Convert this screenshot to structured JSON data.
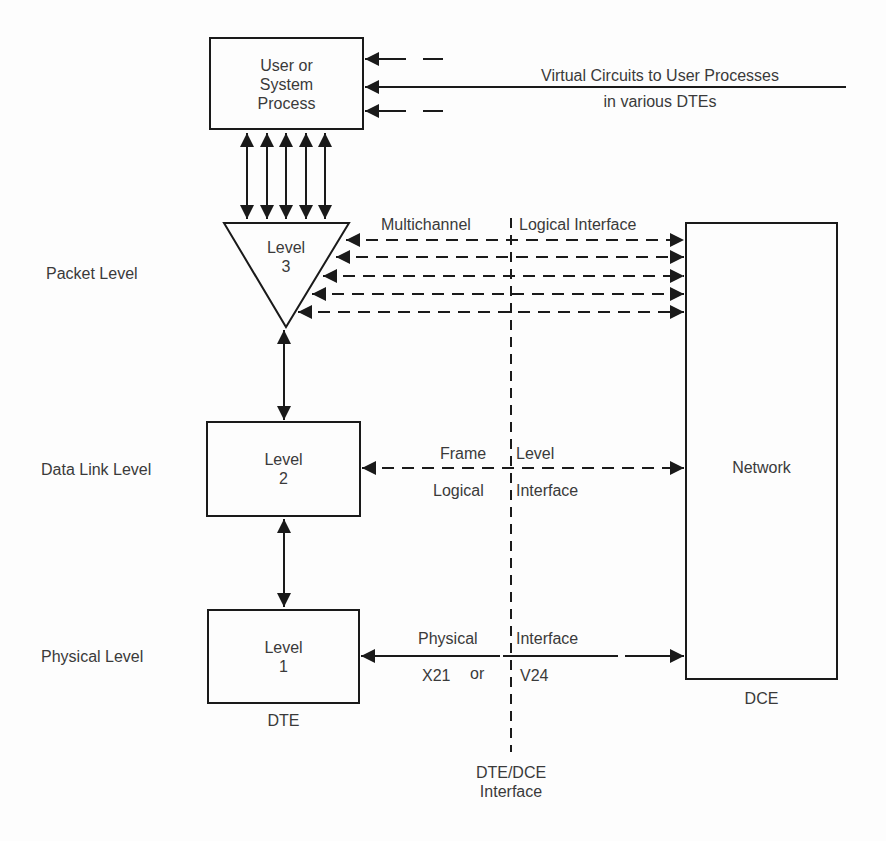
{
  "diagram": {
    "colors": {
      "line": "#1a1a1a",
      "text": "#3a3a3a",
      "background": "#fdfdfd"
    },
    "nodes": {
      "user_process": {
        "line1": "User or",
        "line2": "System",
        "line3": "Process"
      },
      "level3": {
        "line1": "Level",
        "line2": "3"
      },
      "level2": {
        "line1": "Level",
        "line2": "2"
      },
      "level1": {
        "line1": "Level",
        "line2": "1"
      },
      "network": {
        "label": "Network"
      }
    },
    "level_labels": {
      "packet": "Packet Level",
      "data_link": "Data Link Level",
      "physical": "Physical Level"
    },
    "side_labels": {
      "dte": "DTE",
      "dce": "DCE"
    },
    "virtual_circuits": {
      "line1": "Virtual Circuits to User Processes",
      "line2": "in various DTEs"
    },
    "interfaces": {
      "multichannel_left": "Multichannel",
      "multichannel_right": "Logical Interface",
      "frame_top_left": "Frame",
      "frame_top_right": "Level",
      "frame_bottom_left": "Logical",
      "frame_bottom_right": "Interface",
      "physical_top_left": "Physical",
      "physical_top_right": "Interface",
      "physical_bottom_left": "X21",
      "physical_or": "or",
      "physical_bottom_right": "V24",
      "dte_dce_line1": "DTE/DCE",
      "dte_dce_line2": "Interface"
    },
    "connections": {
      "process_to_level3_count": 5,
      "level3_to_network_channels": 5
    }
  }
}
